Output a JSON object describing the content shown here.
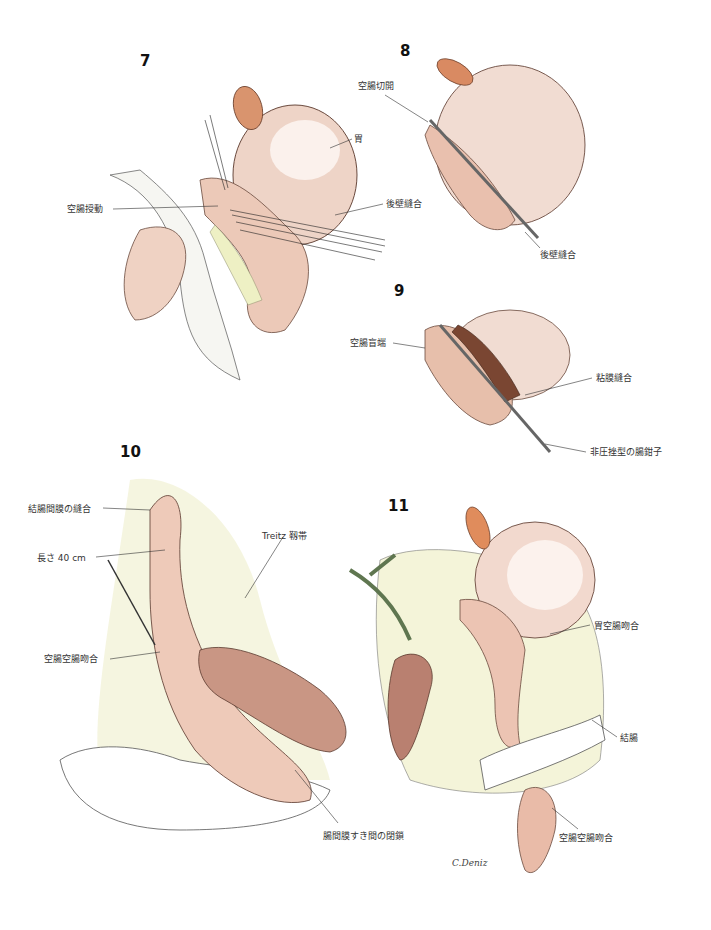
{
  "figures": [
    {
      "number": "7",
      "labels": [
        "空腸授動",
        "胃",
        "後壁縫合"
      ]
    },
    {
      "number": "8",
      "labels": [
        "空腸切開",
        "後壁縫合"
      ]
    },
    {
      "number": "9",
      "labels": [
        "空腸盲端",
        "粘膜縫合",
        "非圧挫型の腸鉗子"
      ]
    },
    {
      "number": "10",
      "labels": [
        "結腸間膜の縫合",
        "長さ 40 cm",
        "Treitz 靱帯",
        "空腸空腸吻合",
        "腸間膜すき間の閉鎖"
      ]
    },
    {
      "number": "11",
      "labels": [
        "胃空腸吻合",
        "結腸",
        "空腸空腸吻合"
      ]
    }
  ],
  "signature": "C.Deniz",
  "colors": {
    "tissue_pink": "#e9c0ae",
    "tissue_dark": "#a7705c",
    "fat_yellow": "#eef0c4",
    "spleen_orange": "#d98a62",
    "vessel_green": "#5f7650",
    "line": "#2a2a2a"
  }
}
